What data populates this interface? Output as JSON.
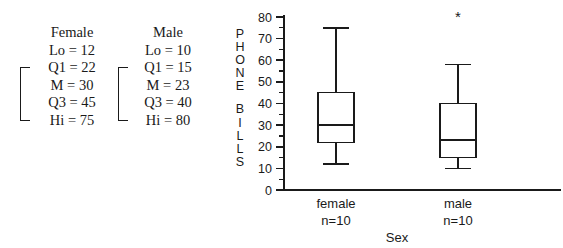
{
  "summaries": [
    {
      "title": "Female",
      "lines": [
        "Lo = 12",
        "Q1 = 22",
        "M = 30",
        "Q3 = 45",
        "Hi = 75"
      ]
    },
    {
      "title": "Male",
      "lines": [
        "Lo = 10",
        "Q1 = 15",
        "M = 23",
        "Q3 = 40",
        "Hi = 80"
      ]
    }
  ],
  "chart_data": {
    "type": "boxplot",
    "title": "",
    "xlabel": "Sex",
    "ylabel": "PHONE BILLS",
    "ylabel_lines": [
      "P",
      "H",
      "O",
      "N",
      "E",
      "B",
      "I",
      "L",
      "L",
      "S"
    ],
    "ylim": [
      0,
      80
    ],
    "ytick_labels": [
      "0",
      "10",
      "20",
      "30",
      "40",
      "50",
      "60",
      "70",
      "80"
    ],
    "ytick_values": [
      0,
      10,
      20,
      30,
      40,
      50,
      60,
      70,
      80
    ],
    "yminor_step": 5,
    "grid": false,
    "legend": "none",
    "categories": [
      "female",
      "male"
    ],
    "category_sublabels": [
      "n=10",
      "n=10"
    ],
    "boxes": [
      {
        "name": "female",
        "sublabel": "n=10",
        "lower_whisker": 12,
        "q1": 22,
        "median": 30,
        "q3": 45,
        "upper_whisker": 75,
        "outliers": []
      },
      {
        "name": "male",
        "sublabel": "n=10",
        "lower_whisker": 10,
        "q1": 15,
        "median": 23,
        "q3": 40,
        "upper_whisker": 58,
        "outliers": [
          80
        ]
      }
    ],
    "outlier_marker": "*",
    "colors": {
      "line": "#1a1a1a",
      "box_fill": "#ffffff",
      "background": "#ffffff"
    }
  }
}
